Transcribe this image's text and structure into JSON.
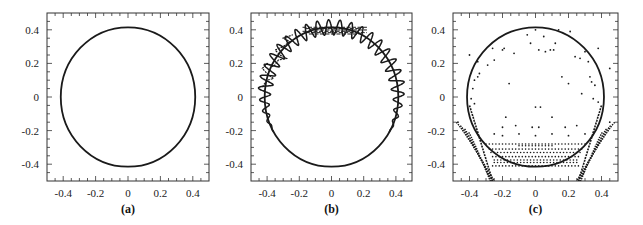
{
  "figure": {
    "panels": [
      {
        "id": "a",
        "caption": "(a)"
      },
      {
        "id": "b",
        "caption": "(b)"
      },
      {
        "id": "c",
        "caption": "(c)"
      }
    ],
    "x_tick_labels": [
      "-0.4",
      "-0.2",
      "0",
      "0.2",
      "0.4"
    ],
    "y_tick_labels": [
      "0.4",
      "0.2",
      "0",
      "-0.2",
      "-0.4"
    ],
    "line_color": "#1a1a1a"
  },
  "chart_data": [
    {
      "type": "line",
      "title": "(a)",
      "xlabel": "",
      "ylabel": "",
      "xlim": [
        -0.5,
        0.5
      ],
      "ylim": [
        -0.5,
        0.5
      ],
      "x_ticks": [
        -0.4,
        -0.2,
        0,
        0.2,
        0.4
      ],
      "y_ticks": [
        -0.4,
        -0.2,
        0,
        0.2,
        0.4
      ],
      "minor_tick_step": 0.05,
      "grid": false,
      "series": [
        {
          "name": "boundary circle",
          "shape": "circle",
          "center": [
            0,
            0
          ],
          "radius": 0.415
        }
      ]
    },
    {
      "type": "line",
      "title": "(b)",
      "xlabel": "",
      "ylabel": "",
      "xlim": [
        -0.5,
        0.5
      ],
      "ylim": [
        -0.5,
        0.5
      ],
      "x_ticks": [
        -0.4,
        -0.2,
        0,
        0.2,
        0.4
      ],
      "y_ticks": [
        -0.4,
        -0.2,
        0,
        0.2,
        0.4
      ],
      "minor_tick_step": 0.05,
      "grid": false,
      "series": [
        {
          "name": "boundary circle",
          "shape": "circle",
          "center": [
            0,
            0
          ],
          "radius": 0.415
        },
        {
          "name": "oscillating trajectory",
          "shape": "wiggle-circle",
          "radius": 0.415,
          "amplitude": 0.045,
          "oscillations": 40,
          "active_from_angle_deg": -30,
          "active_to_angle_deg": 210,
          "note": "sinusoidal deviation around circle on upper/left/right arcs; noisy near top (y≈0.41) and left (x≈-0.4, y 0.05–0.3)"
        }
      ]
    },
    {
      "type": "scatter",
      "title": "(c)",
      "xlabel": "",
      "ylabel": "",
      "xlim": [
        -0.5,
        0.5
      ],
      "ylim": [
        -0.5,
        0.5
      ],
      "x_ticks": [
        -0.4,
        -0.2,
        0,
        0.2,
        0.4
      ],
      "y_ticks": [
        -0.4,
        -0.2,
        0,
        0.2,
        0.4
      ],
      "minor_tick_step": 0.05,
      "grid": false,
      "series": [
        {
          "name": "boundary circle",
          "shape": "circle",
          "center": [
            0,
            0
          ],
          "radius": 0.415
        },
        {
          "name": "scattered points",
          "points": [
            [
              -0.05,
              0.37
            ],
            [
              0.0,
              0.4
            ],
            [
              0.05,
              0.36
            ],
            [
              0.14,
              0.4
            ],
            [
              0.21,
              0.39
            ],
            [
              -0.03,
              0.32
            ],
            [
              0.12,
              0.32
            ],
            [
              -0.4,
              0.25
            ],
            [
              -0.26,
              0.29
            ],
            [
              -0.2,
              0.28
            ],
            [
              -0.19,
              0.29
            ],
            [
              -0.13,
              0.26
            ],
            [
              0.02,
              0.28
            ],
            [
              0.06,
              0.27
            ],
            [
              0.09,
              0.28
            ],
            [
              0.11,
              0.28
            ],
            [
              0.3,
              0.27
            ],
            [
              0.38,
              0.29
            ],
            [
              -0.35,
              0.21
            ],
            [
              -0.29,
              0.19
            ],
            [
              -0.25,
              0.22
            ],
            [
              0.24,
              0.24
            ],
            [
              0.27,
              0.23
            ],
            [
              0.32,
              0.21
            ],
            [
              0.45,
              0.17
            ],
            [
              -0.34,
              0.14
            ],
            [
              -0.35,
              0.12
            ],
            [
              -0.37,
              0.1
            ],
            [
              -0.38,
              0.05
            ],
            [
              -0.16,
              0.08
            ],
            [
              0.16,
              0.12
            ],
            [
              0.2,
              0.08
            ],
            [
              0.33,
              0.12
            ],
            [
              0.34,
              0.09
            ],
            [
              0.36,
              0.07
            ],
            [
              -0.39,
              -0.01
            ],
            [
              -0.37,
              -0.04
            ],
            [
              0.03,
              -0.06
            ],
            [
              0.0,
              -0.06
            ],
            [
              0.35,
              -0.01
            ],
            [
              0.38,
              -0.03
            ],
            [
              0.28,
              0.02
            ],
            [
              -0.18,
              -0.12
            ],
            [
              0.1,
              -0.12
            ],
            [
              -0.12,
              -0.17
            ],
            [
              -0.02,
              -0.18
            ],
            [
              0.02,
              -0.18
            ],
            [
              0.18,
              -0.18
            ],
            [
              -0.2,
              -0.18
            ],
            [
              0.25,
              -0.17
            ],
            [
              -0.25,
              -0.22
            ],
            [
              -0.2,
              -0.23
            ],
            [
              -0.1,
              -0.22
            ],
            [
              0.0,
              -0.23
            ],
            [
              0.1,
              -0.22
            ],
            [
              0.2,
              -0.23
            ],
            [
              0.3,
              -0.22
            ],
            [
              0.45,
              -0.15
            ],
            [
              -0.47,
              -0.15
            ]
          ],
          "row_bands_y": [
            -0.28,
            -0.29,
            -0.31,
            -0.33,
            -0.355,
            -0.375,
            -0.39,
            -0.41
          ],
          "row_band_x_ranges": [
            [
              -0.3,
              0.3
            ],
            [
              -0.1,
              0.1
            ],
            [
              -0.28,
              0.28
            ],
            [
              -0.27,
              0.27
            ],
            [
              -0.26,
              0.26
            ],
            [
              -0.25,
              0.25
            ],
            [
              -0.25,
              0.25
            ],
            [
              -0.26,
              0.26
            ]
          ],
          "dense_bands": "two curved streaks from (-0.48,-0.15) to (-0.25,-0.5) and from (0.48,-0.15) to (0.25,-0.5)"
        }
      ]
    }
  ]
}
